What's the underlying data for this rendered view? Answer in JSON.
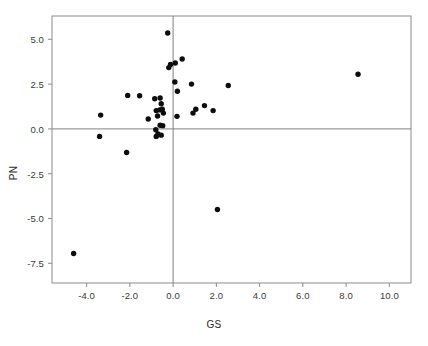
{
  "chart_data": {
    "type": "scatter",
    "title": "",
    "xlabel": "GS",
    "ylabel": "PN",
    "xlim": [
      -5.6,
      11.0
    ],
    "ylim": [
      -8.6,
      6.3
    ],
    "xticks": [
      "-4.0",
      "-2.0",
      "0.0",
      "2.0",
      "4.0",
      "6.0",
      "8.0",
      "10.0"
    ],
    "xtick_values": [
      -4.0,
      -2.0,
      0.0,
      2.0,
      4.0,
      6.0,
      8.0,
      10.0
    ],
    "yticks": [
      "5.0",
      "2.5",
      "0.0",
      "-2.5",
      "-5.0",
      "-7.5"
    ],
    "ytick_values": [
      5.0,
      2.5,
      0.0,
      -2.5,
      -5.0,
      -7.5
    ],
    "grid": false,
    "legend": null,
    "reference_lines": [
      {
        "orientation": "horizontal",
        "value": 0.0,
        "color": "#808080"
      },
      {
        "orientation": "vertical",
        "value": 0.0,
        "color": "#808080"
      }
    ],
    "marker": {
      "shape": "circle",
      "color": "#0d0d0d",
      "size_px": 5.4
    },
    "points": [
      {
        "x": -4.6,
        "y": -6.95
      },
      {
        "x": -3.35,
        "y": 0.77
      },
      {
        "x": -3.4,
        "y": -0.42
      },
      {
        "x": -2.1,
        "y": 1.87
      },
      {
        "x": -2.15,
        "y": -1.32
      },
      {
        "x": -1.55,
        "y": 1.85
      },
      {
        "x": -1.15,
        "y": 0.55
      },
      {
        "x": -0.85,
        "y": 1.68
      },
      {
        "x": -0.6,
        "y": 1.72
      },
      {
        "x": -0.55,
        "y": 1.4
      },
      {
        "x": -0.78,
        "y": 1.02
      },
      {
        "x": -0.62,
        "y": 1.06
      },
      {
        "x": -0.5,
        "y": 1.1
      },
      {
        "x": -0.45,
        "y": 0.88
      },
      {
        "x": -0.72,
        "y": 0.72
      },
      {
        "x": -0.6,
        "y": 0.2
      },
      {
        "x": -0.48,
        "y": 0.18
      },
      {
        "x": -0.8,
        "y": -0.05
      },
      {
        "x": -0.7,
        "y": -0.28
      },
      {
        "x": -0.55,
        "y": -0.35
      },
      {
        "x": -0.78,
        "y": -0.42
      },
      {
        "x": -0.25,
        "y": 5.35
      },
      {
        "x": -0.2,
        "y": 3.42
      },
      {
        "x": -0.12,
        "y": 3.6
      },
      {
        "x": 0.1,
        "y": 3.68
      },
      {
        "x": 0.42,
        "y": 3.9
      },
      {
        "x": 0.08,
        "y": 2.62
      },
      {
        "x": 0.2,
        "y": 2.1
      },
      {
        "x": 0.18,
        "y": 0.7
      },
      {
        "x": 0.85,
        "y": 2.5
      },
      {
        "x": 0.92,
        "y": 0.88
      },
      {
        "x": 1.05,
        "y": 1.1
      },
      {
        "x": 1.45,
        "y": 1.3
      },
      {
        "x": 1.85,
        "y": 1.02
      },
      {
        "x": 2.05,
        "y": -4.5
      },
      {
        "x": 2.55,
        "y": 2.42
      },
      {
        "x": 8.55,
        "y": 3.05
      }
    ]
  },
  "axes": {
    "frame_color": "#8c8c8c",
    "tick_color": "#8c8c8c"
  }
}
